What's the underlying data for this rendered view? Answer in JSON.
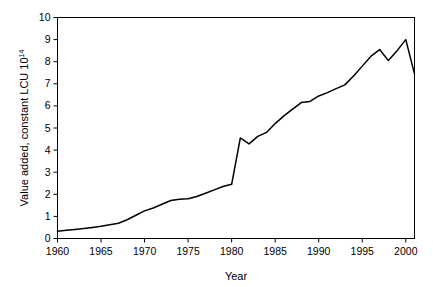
{
  "chart_data": {
    "type": "line",
    "title": "",
    "subtitle": "",
    "xlabel": "Year",
    "ylabel": "Value added, constant LCU 10",
    "ylabel_superscript": "14",
    "ylabel_full": "Value added, constant LCU 10^14",
    "xlim": [
      1960,
      2001
    ],
    "ylim": [
      0,
      10
    ],
    "xticks": [
      1960,
      1965,
      1970,
      1975,
      1980,
      1985,
      1990,
      1995,
      2000
    ],
    "xtick_labels": [
      "1960",
      "1965",
      "1970",
      "1975",
      "1980",
      "1985",
      "1990",
      "1995",
      "2000"
    ],
    "yticks": [
      0,
      1,
      2,
      3,
      4,
      5,
      6,
      7,
      8,
      9,
      10
    ],
    "ytick_labels": [
      "0",
      "1",
      "2",
      "3",
      "4",
      "5",
      "6",
      "7",
      "8",
      "9",
      "10"
    ],
    "grid": false,
    "legend": false,
    "legend_position": "none",
    "line_color": "#000000",
    "background_color": "#ffffff",
    "frame": true,
    "x": [
      1960,
      1961,
      1962,
      1963,
      1964,
      1965,
      1966,
      1967,
      1968,
      1969,
      1970,
      1971,
      1972,
      1973,
      1974,
      1975,
      1976,
      1977,
      1978,
      1979,
      1980,
      1981,
      1982,
      1983,
      1984,
      1985,
      1986,
      1987,
      1988,
      1989,
      1990,
      1991,
      1992,
      1993,
      1994,
      1995,
      1996,
      1997,
      1998,
      1999,
      2000,
      2001
    ],
    "series": [
      {
        "name": "Value added",
        "values": [
          0.33,
          0.37,
          0.41,
          0.45,
          0.5,
          0.55,
          0.62,
          0.69,
          0.85,
          1.05,
          1.25,
          1.38,
          1.55,
          1.72,
          1.78,
          1.8,
          1.9,
          2.05,
          2.2,
          2.35,
          2.45,
          4.55,
          4.28,
          4.62,
          4.8,
          5.2,
          5.55,
          5.85,
          6.15,
          6.2,
          6.45,
          6.6,
          6.78,
          6.95,
          7.35,
          7.8,
          8.25,
          8.55,
          8.05,
          8.5,
          9.0,
          7.45
        ]
      }
    ]
  }
}
